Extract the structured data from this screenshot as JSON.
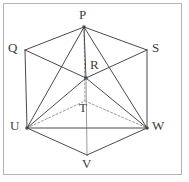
{
  "figure": {
    "name": "hexagonal-prism-pyramid-diagram",
    "canvas": {
      "width": 189,
      "height": 182
    },
    "border": {
      "name": "figure-border",
      "x": 3.5,
      "y": 3.5,
      "width": 178,
      "height": 171,
      "color": "#b4b4b4",
      "stroke_width": 1
    },
    "style": {
      "solid_color": "#4a4a4a",
      "dashed_color": "#9a9a9a",
      "axis_color": "#9a9a9a",
      "solid_width": 1,
      "dashed_width": 1,
      "dash_pattern": "2,2",
      "label_color": "#3d3d3d",
      "background": "#ffffff"
    },
    "vertices": [
      {
        "id": "P",
        "label": "P",
        "x": 84,
        "y": 27,
        "label_x": 79,
        "label_y": 8,
        "dot": true
      },
      {
        "id": "Q",
        "label": "Q",
        "x": 25,
        "y": 50,
        "label_x": 8,
        "label_y": 41,
        "dot": false
      },
      {
        "id": "S",
        "label": "S",
        "x": 147,
        "y": 50,
        "label_x": 152,
        "label_y": 41,
        "dot": false
      },
      {
        "id": "R",
        "label": "R",
        "x": 86,
        "y": 78,
        "label_x": 90,
        "label_y": 58,
        "dot": true
      },
      {
        "id": "T",
        "label": "T",
        "x": 85,
        "y": 101,
        "label_x": 79,
        "label_y": 101,
        "dot": false
      },
      {
        "id": "U",
        "label": "U",
        "x": 27,
        "y": 128,
        "label_x": 10,
        "label_y": 119,
        "dot": true
      },
      {
        "id": "W",
        "label": "W",
        "x": 147,
        "y": 128,
        "label_x": 152,
        "label_y": 119,
        "dot": true
      },
      {
        "id": "V",
        "label": "V",
        "x": 87,
        "y": 155,
        "label_x": 82,
        "label_y": 157,
        "dot": false
      }
    ],
    "edges_solid": [
      {
        "name": "edge-Q-P",
        "from": "Q",
        "to": "P"
      },
      {
        "name": "edge-P-S",
        "from": "P",
        "to": "S"
      },
      {
        "name": "edge-Q-U",
        "from": "Q",
        "to": "U"
      },
      {
        "name": "edge-S-W",
        "from": "S",
        "to": "W"
      },
      {
        "name": "edge-U-V",
        "from": "U",
        "to": "V"
      },
      {
        "name": "edge-V-W",
        "from": "V",
        "to": "W"
      },
      {
        "name": "edge-U-W",
        "from": "U",
        "to": "W"
      },
      {
        "name": "edge-Q-R",
        "from": "Q",
        "to": "R"
      },
      {
        "name": "edge-R-S",
        "from": "R",
        "to": "S"
      },
      {
        "name": "edge-P-U",
        "from": "P",
        "to": "U"
      },
      {
        "name": "edge-P-W",
        "from": "P",
        "to": "W"
      },
      {
        "name": "edge-P-R",
        "from": "P",
        "to": "R"
      },
      {
        "name": "edge-R-U",
        "from": "R",
        "to": "U"
      },
      {
        "name": "edge-R-W",
        "from": "R",
        "to": "W"
      }
    ],
    "edges_dashed": [
      {
        "name": "edge-U-T-hidden",
        "from": "U",
        "to": "T"
      },
      {
        "name": "edge-T-W-hidden",
        "from": "T",
        "to": "W"
      },
      {
        "name": "edge-P-T-axis-hidden",
        "from": "P",
        "to": "T"
      }
    ],
    "edges_axis": [
      {
        "name": "axis-R-V",
        "from": "R",
        "to": "V",
        "color": "#9a9a9a"
      }
    ]
  }
}
